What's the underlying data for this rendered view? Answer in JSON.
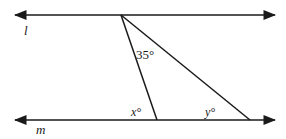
{
  "diagram": {
    "lines": {
      "top": {
        "label": "l",
        "y": 15,
        "x1": 14,
        "x2": 276
      },
      "bottom": {
        "label": "m",
        "y": 120,
        "x1": 14,
        "x2": 276
      }
    },
    "apex": {
      "x": 121,
      "y": 15
    },
    "transversal_left_foot": {
      "x": 157,
      "y": 120
    },
    "transversal_right_foot": {
      "x": 250,
      "y": 120
    },
    "angles": {
      "apex_angle": "35°",
      "left_angle": "x°",
      "right_angle": "y°"
    },
    "stroke_color": "#1a1a1a"
  }
}
